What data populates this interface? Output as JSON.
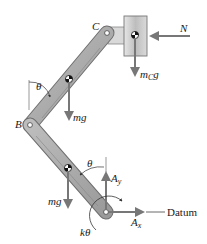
{
  "diagram": {
    "type": "free-body-diagram",
    "labels": {
      "point_b": "B",
      "point_c": "C",
      "force_n": "N",
      "block_weight_main": "m",
      "block_weight_sub": "C",
      "block_weight_tail": "g",
      "upper_link_weight": "mg",
      "lower_link_weight": "mg",
      "upper_angle": "θ",
      "lower_angle": "θ",
      "reaction_y_main": "A",
      "reaction_y_sub": "y",
      "reaction_x_main": "A",
      "reaction_x_sub": "x",
      "spring_moment": "kθ",
      "datum": "Datum"
    },
    "colors": {
      "link_fill": "#a8a8a8",
      "link_edge": "#6e6e6e",
      "block_fill": "#c8c8c8",
      "arrow": "#7a7a7a",
      "text": "#1a1a1a"
    }
  }
}
